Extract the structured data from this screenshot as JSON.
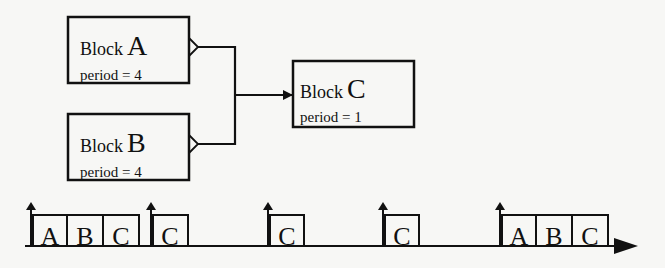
{
  "blocks": [
    {
      "id": "A",
      "prefix": "Block",
      "letter": "A",
      "period_label": "period = 4"
    },
    {
      "id": "B",
      "prefix": "Block",
      "letter": "B",
      "period_label": "period = 4"
    },
    {
      "id": "C",
      "prefix": "Block",
      "letter": "C",
      "period_label": "period = 1"
    }
  ],
  "timeline": {
    "groups": [
      {
        "cells": [
          "A",
          "B",
          "C"
        ]
      },
      {
        "cells": [
          "C"
        ]
      },
      {
        "cells": [
          "C"
        ]
      },
      {
        "cells": [
          "C"
        ]
      },
      {
        "cells": [
          "A",
          "B",
          "C"
        ]
      }
    ]
  },
  "colors": {
    "stroke": "#111111",
    "background": "#f7f7f5"
  }
}
